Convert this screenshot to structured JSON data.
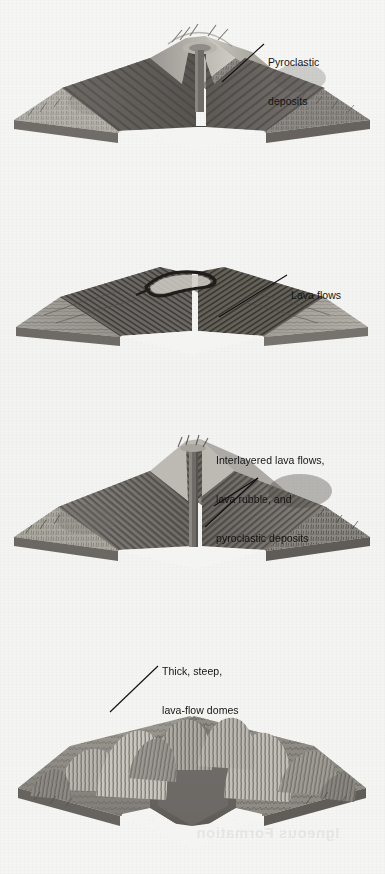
{
  "page": {
    "background_color": "#f5f5f3",
    "ink_color": "#141414",
    "width": 385,
    "height": 874
  },
  "figures": [
    {
      "id": "cinder-cone",
      "name": "cinder-cone-volcano",
      "caption": "Cross-sectioned cone of layered pyroclastic beds with central vent",
      "label": {
        "lines": [
          "Pyroclastic",
          "deposits"
        ],
        "x": 268,
        "y": 36
      },
      "leader": {
        "from_x": 222,
        "from_y": 82,
        "to_x": 264,
        "to_y": 44
      }
    },
    {
      "id": "shield",
      "name": "shield-volcano",
      "caption": "Broad low shield built of thin stacked lava flows with summit caldera",
      "label": {
        "lines": [
          "Lava flows"
        ],
        "x": 291,
        "y": 269
      },
      "leader": {
        "from_x": 219,
        "from_y": 317,
        "to_x": 287,
        "to_y": 275
      }
    },
    {
      "id": "composite",
      "name": "composite-stratovolcano",
      "caption": "Steep cone of interlayered flows, rubble and pyroclastic beds with conduit",
      "label": {
        "lines": [
          "Interlayered lava flows,",
          "lava rubble, and",
          "pyroclastic deposits"
        ],
        "x": 216,
        "y": 434
      },
      "leaders": [
        {
          "from_x": 214,
          "from_y": 506,
          "to_x": 258,
          "to_y": 478
        },
        {
          "from_x": 205,
          "from_y": 527,
          "to_x": 258,
          "to_y": 478
        }
      ]
    },
    {
      "id": "dome-complex",
      "name": "lava-dome-complex",
      "caption": "Cluster of rugged steep-sided lava domes cut away at the centre",
      "label": {
        "lines": [
          "Thick, steep,",
          "lava-flow domes"
        ],
        "x": 162,
        "y": 645
      },
      "leader": {
        "from_x": 110,
        "from_y": 712,
        "to_x": 158,
        "to_y": 666
      }
    }
  ],
  "showthrough": [
    {
      "text": "Igneous Formation",
      "x": 196,
      "y": 836,
      "size": 15
    }
  ]
}
